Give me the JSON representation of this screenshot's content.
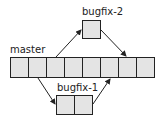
{
  "diagram": {
    "type": "git-branching",
    "colors": {
      "cell_fill": "#e4e4e4",
      "stroke": "#222222"
    },
    "branches": [
      {
        "id": "master",
        "label": "master",
        "commits": 8
      },
      {
        "id": "bugfix-2",
        "label": "bugfix-2",
        "commits": 1,
        "branches_from_commit": 3,
        "merges_into_commit": 7
      },
      {
        "id": "bugfix-1",
        "label": "bugfix-1",
        "commits": 2,
        "branches_from_commit": 2,
        "merges_into_commit": 6
      }
    ]
  }
}
